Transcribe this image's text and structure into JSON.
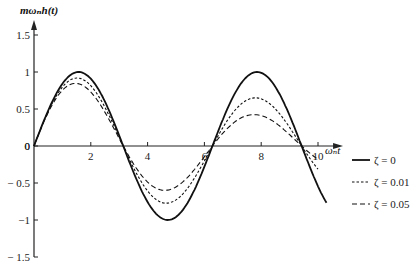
{
  "chart_data": {
    "type": "line",
    "title": "",
    "ylabel": "mωₙh(t)",
    "xlabel": "ωₙt",
    "xlim": [
      0,
      10.3
    ],
    "ylim": [
      -1.5,
      1.5
    ],
    "x_ticks": [
      2,
      4,
      6,
      8,
      10
    ],
    "x_tick_labels": [
      "2",
      "4",
      "6",
      "8",
      "10"
    ],
    "y_ticks": [
      1.5,
      1,
      0.5,
      0,
      -0.5,
      -1,
      -1.5
    ],
    "y_tick_labels": [
      "1.5",
      "1",
      "0.5",
      "0",
      "− 0.5",
      "−1",
      "− 1.5"
    ],
    "grid": false,
    "legend_position": "right",
    "x_end": 10.3,
    "series": [
      {
        "name": "ζ = 0",
        "style": "solid",
        "decay": 0.0,
        "points_note": "sin(t)",
        "x": [
          0,
          1.57,
          3.14,
          4.71,
          6.28,
          7.85,
          9.42,
          10.3
        ],
        "values": [
          0,
          1.0,
          0,
          -1.0,
          0,
          1.0,
          0,
          -0.6
        ]
      },
      {
        "name": "ζ = 0.01",
        "style": "dotted",
        "decay": 0.055,
        "x": [
          0,
          1.57,
          3.14,
          4.71,
          6.28,
          7.85,
          9.42
        ],
        "values": [
          0,
          0.92,
          0,
          -0.78,
          0,
          0.65,
          0
        ]
      },
      {
        "name": "ζ = 0.05",
        "style": "dashed",
        "decay": 0.11,
        "x": [
          0,
          1.57,
          3.14,
          4.71,
          6.28,
          7.85,
          9.42
        ],
        "values": [
          0,
          0.85,
          0,
          -0.6,
          0,
          0.42,
          0
        ]
      }
    ]
  }
}
